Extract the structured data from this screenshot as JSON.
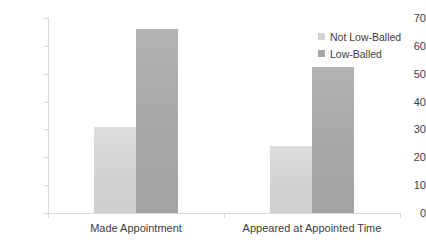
{
  "chart_data": {
    "type": "bar",
    "title": "",
    "xlabel": "",
    "ylabel": "",
    "categories": [
      "Made Appointment",
      "Appeared at Appointed Time"
    ],
    "series": [
      {
        "name": "Not Low-Balled",
        "color": "#d2d2d2",
        "values": [
          31,
          24
        ]
      },
      {
        "name": "Low-Balled",
        "color": "#a7a7a7",
        "values": [
          66,
          52.5
        ]
      }
    ],
    "ylim": [
      0,
      70
    ],
    "ytick_step": 10,
    "yticks": [
      70,
      60,
      50,
      40,
      30,
      20,
      10,
      0
    ],
    "grid": false,
    "legend_position": "top-right"
  }
}
